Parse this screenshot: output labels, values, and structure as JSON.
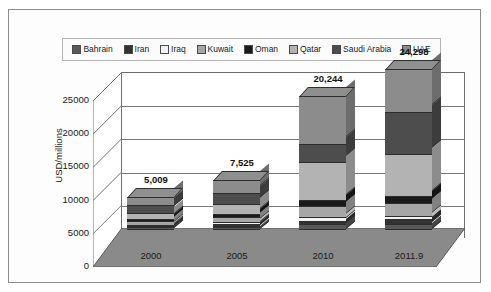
{
  "caption_fragment": "",
  "figure": {
    "ylabel": "USD/millions",
    "legend": {
      "position": "top",
      "entries": [
        {
          "label": "Bahrain",
          "color": "#595959"
        },
        {
          "label": "Iran",
          "color": "#333333"
        },
        {
          "label": "Iraq",
          "color": "#f2f2f2"
        },
        {
          "label": "Kuwait",
          "color": "#a6a6a6"
        },
        {
          "label": "Oman",
          "color": "#1a1a1a"
        },
        {
          "label": "Qatar",
          "color": "#b3b3b3"
        },
        {
          "label": "Saudi Arabia",
          "color": "#4d4d4d"
        },
        {
          "label": "UAE",
          "color": "#8c8c8c"
        }
      ]
    },
    "yticks": [
      "25000",
      "20000",
      "15000",
      "10000",
      "5000",
      "0"
    ]
  },
  "chart_data": {
    "type": "bar",
    "title": "",
    "subtitle": "",
    "xlabel": "",
    "ylabel": "USD/millions",
    "ylim": [
      0,
      25000
    ],
    "ytick_values": [
      0,
      5000,
      10000,
      15000,
      20000,
      25000
    ],
    "grid": true,
    "stacked": true,
    "three_d": true,
    "legend_position": "top",
    "categories": [
      "2000",
      "2005",
      "2010",
      "2011.9"
    ],
    "series": [
      {
        "name": "Bahrain",
        "color": "#595959",
        "values": [
          220,
          330,
          700,
          800
        ]
      },
      {
        "name": "Iran",
        "color": "#333333",
        "values": [
          240,
          360,
          560,
          650
        ]
      },
      {
        "name": "Iraq",
        "color": "#f2f2f2",
        "values": [
          180,
          300,
          480,
          560
        ]
      },
      {
        "name": "Kuwait",
        "color": "#a6a6a6",
        "values": [
          560,
          800,
          1700,
          1900
        ]
      },
      {
        "name": "Oman",
        "color": "#1a1a1a",
        "values": [
          330,
          480,
          900,
          1050
        ]
      },
      {
        "name": "Qatar",
        "color": "#b3b3b3",
        "values": [
          900,
          1450,
          5700,
          6300
        ]
      },
      {
        "name": "Saudi Arabia",
        "color": "#4d4d4d",
        "values": [
          1120,
          1680,
          2800,
          6400
        ]
      },
      {
        "name": "UAE",
        "color": "#8c8c8c",
        "values": [
          1459,
          2125,
          7404,
          6638
        ]
      }
    ],
    "totals": [
      "5,009",
      "7,525",
      "20,244",
      "24,298"
    ],
    "total_values": [
      5009,
      7525,
      20244,
      24298
    ]
  }
}
